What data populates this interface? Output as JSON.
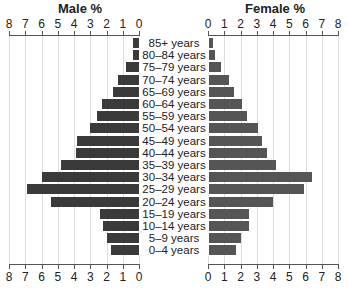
{
  "chart_data": {
    "type": "bar",
    "subtype": "population-pyramid",
    "titles": {
      "left": "Male %",
      "right": "Female %"
    },
    "categories": [
      "85+ years",
      "80–84 years",
      "75–79 years",
      "70–74 years",
      "65–69 years",
      "60–64 years",
      "55–59 years",
      "50–54 years",
      "45–49 years",
      "40–44 years",
      "35–39 years",
      "30–34 years",
      "25–29 years",
      "20–24 years",
      "15–19 years",
      "10–14 years",
      "5–9 years",
      "0–4 years"
    ],
    "series": [
      {
        "name": "Male %",
        "color": "#3a3a3a",
        "values": [
          0.4,
          0.4,
          0.8,
          1.3,
          1.6,
          2.3,
          2.6,
          3.0,
          3.8,
          3.9,
          4.8,
          6.0,
          6.9,
          5.4,
          2.4,
          2.2,
          2.0,
          1.7
        ]
      },
      {
        "name": "Female %",
        "color": "#555555",
        "values": [
          0.3,
          0.4,
          0.8,
          1.3,
          1.6,
          2.1,
          2.4,
          3.1,
          3.3,
          3.6,
          4.2,
          6.4,
          5.9,
          4.0,
          2.5,
          2.5,
          2.0,
          1.7
        ]
      }
    ],
    "left_ticks": [
      "8",
      "7",
      "6",
      "5",
      "4",
      "3",
      "2",
      "1",
      "0"
    ],
    "right_ticks": [
      "0",
      "1",
      "2",
      "3",
      "4",
      "5",
      "6",
      "7",
      "8"
    ],
    "xlim": [
      0,
      8
    ],
    "grid": true
  }
}
